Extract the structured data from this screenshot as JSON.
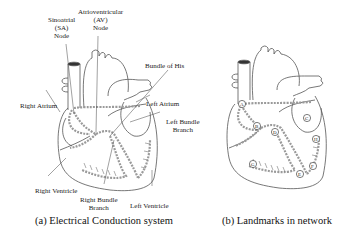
{
  "figure": {
    "panels": [
      {
        "id": "a",
        "caption": "(a) Electrical Conduction system",
        "labels": {
          "sa_node": [
            "Sinoatrial",
            "(SA)",
            "Node"
          ],
          "av_node": [
            "Atrioventricular",
            "(AV)",
            "Node"
          ],
          "bundle_of_his": "Bundle of His",
          "right_atrium": "Right Atrium",
          "left_atrium": "Left Atrium",
          "left_bundle_branch": [
            "Left Bundle",
            "Branch"
          ],
          "right_ventricle": "Right Ventricle",
          "right_bundle_branch": [
            "Right Bundle",
            "Branch"
          ],
          "left_ventricle": "Left Ventricle"
        }
      },
      {
        "id": "b",
        "caption": "(b) Landmarks in network",
        "landmarks": [
          "A",
          "B",
          "C",
          "D",
          "E",
          "F",
          "G",
          "H"
        ]
      }
    ]
  },
  "colors": {
    "outline": "#555555",
    "conduction_path": "#9a9a9a",
    "text": "#222222"
  }
}
